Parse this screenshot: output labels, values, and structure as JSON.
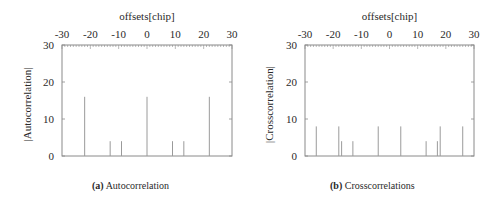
{
  "chart_data": [
    {
      "type": "bar",
      "title": "",
      "caption_tag": "(a)",
      "caption": "Autocorrelation",
      "xlabel": "offsets[chip]",
      "ylabel": "|Autocorrelation|",
      "xlim": [
        -30,
        30
      ],
      "ylim": [
        0,
        30
      ],
      "xticks": [
        -30,
        -20,
        -10,
        0,
        10,
        20,
        30
      ],
      "yticks": [
        0,
        10,
        20,
        30
      ],
      "x_axis_position": "top",
      "grid": false,
      "x": [
        -22,
        -13,
        -9,
        0,
        9,
        13,
        22
      ],
      "values": [
        16,
        4,
        4,
        16,
        4,
        4,
        16
      ],
      "colors": {
        "bar": "#9a9a9a",
        "frame": "#8a8a8a",
        "text": "#2a2a2a"
      }
    },
    {
      "type": "bar",
      "title": "",
      "caption_tag": "(b)",
      "caption": "Crosscorrelations",
      "xlabel": "offsets[chip]",
      "ylabel": "|Crosscorrelation|",
      "xlim": [
        -30,
        30
      ],
      "ylim": [
        0,
        30
      ],
      "xticks": [
        -30,
        -20,
        -10,
        0,
        10,
        20,
        30
      ],
      "yticks": [
        0,
        10,
        20,
        30
      ],
      "x_axis_position": "top",
      "grid": false,
      "x": [
        -26,
        -18,
        -17,
        -13,
        -4,
        4,
        13,
        17,
        18,
        26
      ],
      "values": [
        8,
        8,
        4,
        4,
        8,
        8,
        4,
        4,
        8,
        8
      ],
      "colors": {
        "bar": "#9a9a9a",
        "frame": "#8a8a8a",
        "text": "#2a2a2a"
      }
    }
  ]
}
